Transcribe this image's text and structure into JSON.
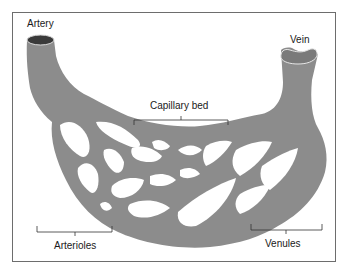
{
  "diagram": {
    "labels": {
      "artery": "Artery",
      "vein": "Vein",
      "capillary_bed": "Capillary bed",
      "arterioles": "Arterioles",
      "venules": "Venules"
    },
    "colors": {
      "vessel": "#8c8c8c",
      "lumen": "#3a3a3a",
      "vein_lumen": "#7a7a7a",
      "frame": "#6d6d6d",
      "label_line": "#333333",
      "background": "#ffffff"
    }
  }
}
